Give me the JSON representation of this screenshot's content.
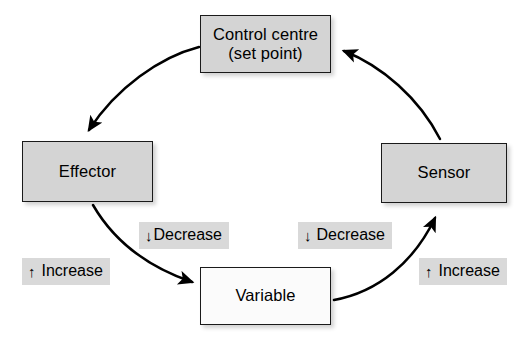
{
  "diagram": {
    "type": "cycle-diagram",
    "colors": {
      "node_fill": "#d4d4d4",
      "node_fill_variable": "#fbfbfb",
      "node_border": "#1a1a1a",
      "label_background": "#d9d9d9",
      "arrow": "#000000",
      "text": "#000000",
      "page_background": "#ffffff"
    },
    "nodes": [
      {
        "id": "control-centre",
        "label": "Control centre\n(set point)",
        "line1": "Control centre",
        "line2": "(set point)",
        "fill": "#d4d4d4"
      },
      {
        "id": "effector",
        "label": "Effector",
        "fill": "#d4d4d4"
      },
      {
        "id": "sensor",
        "label": "Sensor",
        "fill": "#d4d4d4"
      },
      {
        "id": "variable",
        "label": "Variable",
        "fill": "#fbfbfb"
      }
    ],
    "edge_labels": [
      {
        "id": "decrease-left",
        "glyph": "↓",
        "glyph_name": "down-arrow-icon",
        "text": "Decrease"
      },
      {
        "id": "decrease-right",
        "glyph": "↓",
        "glyph_name": "down-arrow-icon",
        "text": "Decrease"
      },
      {
        "id": "increase-left",
        "glyph": "↑",
        "glyph_name": "up-arrow-icon",
        "text": "Increase"
      },
      {
        "id": "increase-right",
        "glyph": "↑",
        "glyph_name": "up-arrow-icon",
        "text": "Increase"
      }
    ],
    "edges": [
      {
        "id": "control-centre-to-effector",
        "from": "control-centre",
        "to": "effector",
        "style": "curved-arrow"
      },
      {
        "id": "effector-to-variable",
        "from": "effector",
        "to": "variable",
        "style": "curved-arrow"
      },
      {
        "id": "variable-to-sensor",
        "from": "variable",
        "to": "sensor",
        "style": "curved-arrow"
      },
      {
        "id": "sensor-to-control-centre",
        "from": "sensor",
        "to": "control-centre",
        "style": "curved-arrow"
      }
    ]
  }
}
